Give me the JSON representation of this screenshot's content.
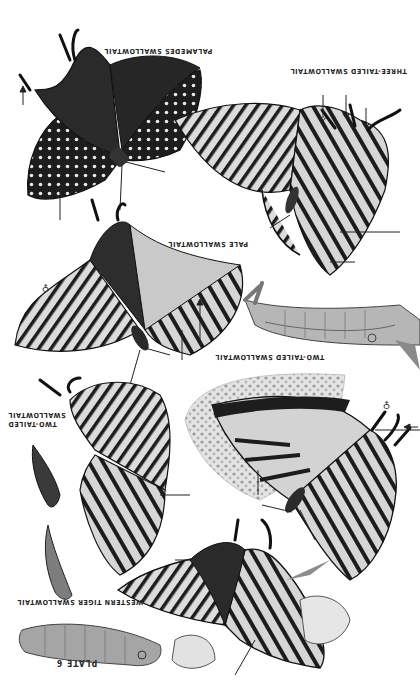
{
  "plate": {
    "title": "PLATE 6",
    "orientation_deg": 180,
    "background": "#ffffff",
    "ink": "#1c1c1c",
    "wing_pale": "#d9d9d9",
    "wing_mid": "#a8a8a8"
  },
  "labels": {
    "palamedes": "PALAMEDES SWALLOWTAIL",
    "three_tailed": "THREE-TAILED SWALLOWTAIL",
    "pale": "PALE SWALLOWTAIL",
    "two_tailed_larva": "TWO-TAILED SWALLOWTAIL",
    "two_tailed_pupae": "TWO-TAILED\nSWALLOWTAIL",
    "western_tiger": "WESTERN TIGER SWALLOWTAIL"
  },
  "sex_symbols": {
    "pale": "♀",
    "two_tailed_adult": "♀"
  },
  "specimens": [
    {
      "name": "palamedes-swallowtail-adult",
      "stage": "adult"
    },
    {
      "name": "three-tailed-swallowtail-adult",
      "stage": "adult"
    },
    {
      "name": "pale-swallowtail-adult",
      "stage": "adult"
    },
    {
      "name": "two-tailed-swallowtail-larva",
      "stage": "larva"
    },
    {
      "name": "two-tailed-swallowtail-pupa",
      "stage": "pupa"
    },
    {
      "name": "two-tailed-swallowtail-adult",
      "stage": "adult"
    },
    {
      "name": "western-tiger-swallowtail-adult",
      "stage": "adult"
    },
    {
      "name": "western-tiger-swallowtail-pupa",
      "stage": "pupa"
    },
    {
      "name": "western-tiger-swallowtail-larva",
      "stage": "larva"
    }
  ]
}
